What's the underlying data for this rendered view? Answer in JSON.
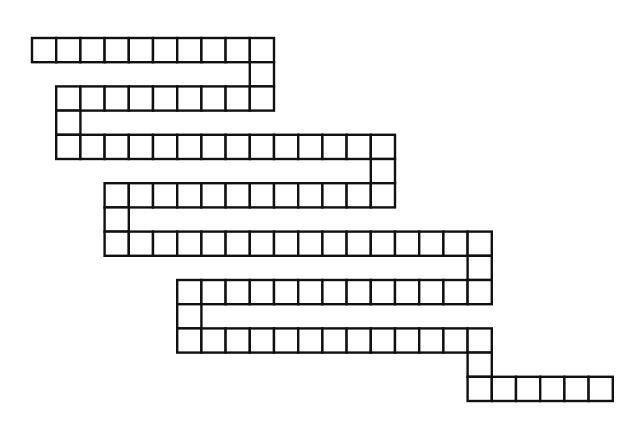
{
  "puzzle": {
    "type": "snake word grid",
    "colors": {
      "cell_fill": "#ffffff",
      "cell_border": "#111111",
      "background": "#ffffff"
    },
    "rows": [
      {
        "row": 0,
        "cols": [
          0,
          9
        ]
      },
      {
        "row": 1,
        "cols": [
          9,
          9
        ]
      },
      {
        "row": 2,
        "cols": [
          1,
          9
        ]
      },
      {
        "row": 3,
        "cols": [
          1,
          1
        ]
      },
      {
        "row": 4,
        "cols": [
          1,
          14
        ]
      },
      {
        "row": 5,
        "cols": [
          14,
          14
        ]
      },
      {
        "row": 6,
        "cols": [
          3,
          14
        ]
      },
      {
        "row": 7,
        "cols": [
          3,
          3
        ]
      },
      {
        "row": 8,
        "cols": [
          3,
          18
        ]
      },
      {
        "row": 9,
        "cols": [
          18,
          18
        ]
      },
      {
        "row": 10,
        "cols": [
          6,
          18
        ]
      },
      {
        "row": 11,
        "cols": [
          6,
          6
        ]
      },
      {
        "row": 12,
        "cols": [
          6,
          18
        ]
      },
      {
        "row": 13,
        "cols": [
          18,
          18
        ]
      },
      {
        "row": 14,
        "cols": [
          18,
          23
        ]
      }
    ],
    "total_cells": 107
  }
}
